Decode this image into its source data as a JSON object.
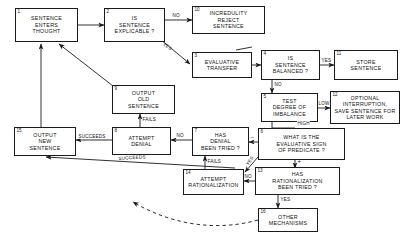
{
  "diagram": {
    "stroke_color": "#1a1a1a",
    "background_color": "#ffffff",
    "nodes": [
      {
        "num": "1",
        "label": "SENTENCE\nENTERS\nTHOUGHT"
      },
      {
        "num": "2",
        "label": "IS\nSENTENCE\nEXPLICABLE ?"
      },
      {
        "num": "3",
        "label": "EVALUATIVE\nTRANSFER"
      },
      {
        "num": "4",
        "label": "IS\nSENTENCE\nBALANCED ?"
      },
      {
        "num": "5",
        "label": "TEST\nDEGREE OF\nIMBALANCE"
      },
      {
        "num": "6",
        "label": "WHAT IS THE\nEVALUATIVE  SIGN\nOF PREDICATE ?"
      },
      {
        "num": "7",
        "label": "HAS\nDENIAL\nBEEN TRIED ?"
      },
      {
        "num": "8",
        "label": "ATTEMPT\nDENIAL"
      },
      {
        "num": "9",
        "label": "OUTPUT\nOLD\nSENTENCE"
      },
      {
        "num": "10",
        "label": "INCREDULITY\nREJECT\nSENTENCE"
      },
      {
        "num": "11",
        "label": "STORE\nSENTENCE"
      },
      {
        "num": "12",
        "label": "OPTIONAL\nINTERRUPTION,\nSAVE SENTENCE FOR\nLATER WORK"
      },
      {
        "num": "13",
        "label": "HAS\nRATIONALIZATION\nBEEN TRIED ?"
      },
      {
        "num": "14",
        "label": "ATTEMPT\nRATIONALIZATION"
      },
      {
        "num": "15",
        "label": "OUTPUT\nNEW\nSENTENCE"
      },
      {
        "num": "16",
        "label": "OTHER\nMECHANISMS"
      }
    ],
    "edge_labels": {
      "no_2_to_10": "NO",
      "yes_2_to_3": "YES",
      "yes_4_to_11": "YES",
      "no_4_to_5": "NO",
      "low_5_to_12": "LOW",
      "high_5_to_6": "HIGH",
      "minus_6_to_7": "–",
      "plus_6_to_13": "+",
      "yes_6_to_14": "YES",
      "no_7_to_8": "NO",
      "fails_7_to_14": "FAILS",
      "no_13_to_14": "NO",
      "yes_13_to_16": "YES",
      "fails_8_to_9": "FAILS",
      "succeeds_8_to_15": "SUCCEEDS",
      "succeeds_14_to_15": "SUCCEEDS"
    }
  }
}
